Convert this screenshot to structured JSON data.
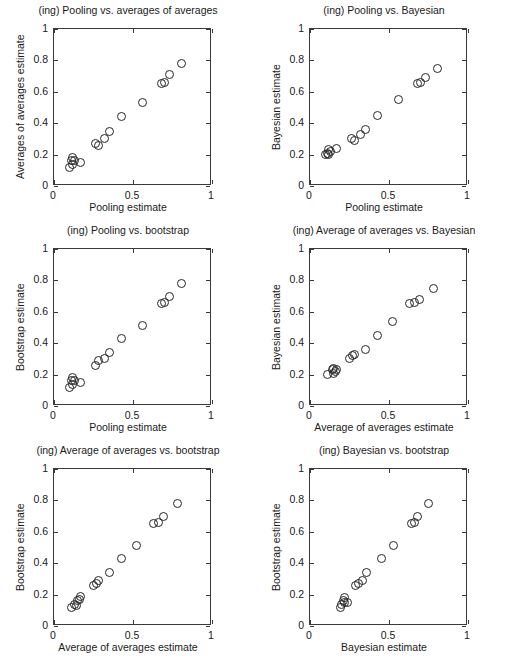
{
  "figure": {
    "background_color": "#ffffff",
    "axis_color": "#3a3a3a",
    "marker_color": "#262626",
    "rows": 3,
    "cols": 2
  },
  "axis": {
    "xticks": [
      "0",
      "0.5",
      "1"
    ],
    "yticks": [
      "0",
      "0.2",
      "0.4",
      "0.6",
      "0.8",
      "1"
    ],
    "xtick_values": [
      0,
      0.5,
      1
    ],
    "ytick_values": [
      0,
      0.2,
      0.4,
      0.6,
      0.8,
      1
    ],
    "xlim": [
      0,
      1
    ],
    "ylim": [
      0,
      1
    ]
  },
  "chart_data": [
    {
      "type": "scatter",
      "title": "(ing) Pooling vs. averages of averages",
      "xlabel": "Pooling estimate",
      "ylabel": "Averages of averages estimate",
      "xlim": [
        0,
        1
      ],
      "ylim": [
        0,
        1
      ],
      "grid": false,
      "legend": "none",
      "marker": "open-circle",
      "x": [
        0.1,
        0.11,
        0.12,
        0.12,
        0.13,
        0.17,
        0.26,
        0.28,
        0.32,
        0.35,
        0.43,
        0.56,
        0.68,
        0.7,
        0.73,
        0.81
      ],
      "y": [
        0.12,
        0.16,
        0.14,
        0.18,
        0.16,
        0.15,
        0.27,
        0.26,
        0.3,
        0.35,
        0.44,
        0.53,
        0.65,
        0.66,
        0.71,
        0.78
      ]
    },
    {
      "type": "scatter",
      "title": "(ing) Pooling vs. Bayesian",
      "xlabel": "Pooling estimate",
      "ylabel": "Bayesian estimate",
      "xlim": [
        0,
        1
      ],
      "ylim": [
        0,
        1
      ],
      "grid": false,
      "legend": "none",
      "marker": "open-circle",
      "x": [
        0.1,
        0.11,
        0.12,
        0.12,
        0.13,
        0.17,
        0.26,
        0.28,
        0.32,
        0.35,
        0.43,
        0.56,
        0.68,
        0.7,
        0.73,
        0.81
      ],
      "y": [
        0.2,
        0.21,
        0.2,
        0.23,
        0.22,
        0.24,
        0.3,
        0.29,
        0.33,
        0.36,
        0.45,
        0.55,
        0.65,
        0.66,
        0.69,
        0.75
      ]
    },
    {
      "type": "scatter",
      "title": "(ing) Pooling vs. bootstrap",
      "xlabel": "Pooling estimate",
      "ylabel": "Bootstrap estimate",
      "xlim": [
        0,
        1
      ],
      "ylim": [
        0,
        1
      ],
      "grid": false,
      "legend": "none",
      "marker": "open-circle",
      "x": [
        0.1,
        0.11,
        0.12,
        0.12,
        0.13,
        0.17,
        0.26,
        0.28,
        0.32,
        0.35,
        0.43,
        0.56,
        0.68,
        0.7,
        0.73,
        0.81
      ],
      "y": [
        0.12,
        0.16,
        0.14,
        0.18,
        0.16,
        0.15,
        0.26,
        0.29,
        0.3,
        0.34,
        0.43,
        0.51,
        0.65,
        0.66,
        0.7,
        0.78
      ]
    },
    {
      "type": "scatter",
      "title": "(ing) Average of averages vs. Bayesian",
      "xlabel": "Average of averages estimate",
      "ylabel": "Bayesian estimate",
      "xlim": [
        0,
        1
      ],
      "ylim": [
        0,
        1
      ],
      "grid": false,
      "legend": "none",
      "marker": "open-circle",
      "x": [
        0.11,
        0.14,
        0.15,
        0.15,
        0.16,
        0.17,
        0.25,
        0.27,
        0.28,
        0.35,
        0.43,
        0.52,
        0.63,
        0.66,
        0.69,
        0.78
      ],
      "y": [
        0.2,
        0.23,
        0.21,
        0.24,
        0.22,
        0.23,
        0.3,
        0.32,
        0.33,
        0.36,
        0.45,
        0.54,
        0.65,
        0.66,
        0.68,
        0.75
      ]
    },
    {
      "type": "scatter",
      "title": "(ing) Average of averages vs. bootstrap",
      "xlabel": "Average of averages estimate",
      "ylabel": "Bootstrap estimate",
      "xlim": [
        0,
        1
      ],
      "ylim": [
        0,
        1
      ],
      "grid": false,
      "legend": "none",
      "marker": "open-circle",
      "x": [
        0.11,
        0.13,
        0.14,
        0.15,
        0.16,
        0.17,
        0.25,
        0.27,
        0.28,
        0.35,
        0.43,
        0.52,
        0.63,
        0.66,
        0.69,
        0.78
      ],
      "y": [
        0.12,
        0.14,
        0.13,
        0.16,
        0.17,
        0.19,
        0.26,
        0.27,
        0.29,
        0.34,
        0.43,
        0.51,
        0.65,
        0.66,
        0.7,
        0.78
      ]
    },
    {
      "type": "scatter",
      "title": "(ing) Bayesian vs. bootstrap",
      "xlabel": "Bayesian estimate",
      "ylabel": "Bootstrap estimate",
      "xlim": [
        0,
        1
      ],
      "ylim": [
        0,
        1
      ],
      "grid": false,
      "legend": "none",
      "marker": "open-circle",
      "x": [
        0.19,
        0.2,
        0.21,
        0.22,
        0.22,
        0.24,
        0.29,
        0.31,
        0.33,
        0.36,
        0.45,
        0.53,
        0.64,
        0.66,
        0.68,
        0.75
      ],
      "y": [
        0.12,
        0.14,
        0.16,
        0.15,
        0.18,
        0.15,
        0.26,
        0.27,
        0.29,
        0.34,
        0.43,
        0.51,
        0.65,
        0.66,
        0.7,
        0.78
      ]
    }
  ]
}
